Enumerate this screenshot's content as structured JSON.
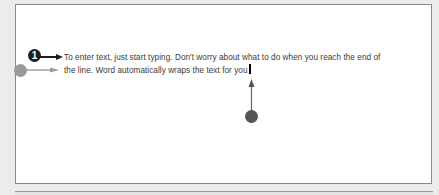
{
  "document": {
    "lines": [
      "To enter text, just start typing. Don't worry about what to do when you reach the end of",
      "the line. Word automatically wraps the text for you"
    ]
  },
  "callouts": {
    "step_number": "1",
    "step_color": "#1e1e1e",
    "wrap_indicator_color": "#999999",
    "cursor_indicator_color": "#555555"
  }
}
